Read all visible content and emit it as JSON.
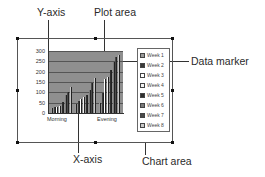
{
  "callouts": {
    "y_axis": "Y-axis",
    "plot_area": "Plot area",
    "data_marker": "Data marker",
    "x_axis": "X-axis",
    "chart_area": "Chart area"
  },
  "chart_data": {
    "type": "bar",
    "title": "",
    "xlabel": "",
    "ylabel": "",
    "ylim": [
      0,
      300
    ],
    "yticks": [
      "300",
      "250",
      "200",
      "150",
      "100",
      "50",
      "0"
    ],
    "categories": [
      "Morning",
      "",
      "Evening"
    ],
    "category_labels_visible": [
      "Morning",
      "Evening"
    ],
    "series": [
      {
        "name": "Week 1",
        "values": [
          25,
          45,
          50
        ]
      },
      {
        "name": "Week 2",
        "values": [
          28,
          60,
          95
        ]
      },
      {
        "name": "Week 3",
        "values": [
          30,
          70,
          165
        ]
      },
      {
        "name": "Week 4",
        "values": [
          35,
          75,
          175
        ]
      },
      {
        "name": "Week 5",
        "values": [
          55,
          85,
          210
        ]
      },
      {
        "name": "Week 6",
        "values": [
          85,
          110,
          245
        ]
      },
      {
        "name": "Week 7",
        "values": [
          100,
          145,
          270
        ]
      },
      {
        "name": "Week 8",
        "values": [
          125,
          170,
          280
        ]
      }
    ],
    "grid": true,
    "legend_position": "right"
  },
  "legend": {
    "items": [
      "Week 1",
      "Week 2",
      "Week 3",
      "Week 4",
      "Week 5",
      "Week 6",
      "Week 7",
      "Week 8"
    ],
    "colors": [
      "#9a9a9a",
      "#3a3a3a",
      "#ffffff",
      "#f2f2f2",
      "#2e2e2e",
      "#7a7a7a",
      "#4a4a4a",
      "#c8c8c8"
    ]
  },
  "colors": {
    "plot_background": "#8f8f8f",
    "frame": "#555555",
    "text": "#2a2a2a"
  }
}
